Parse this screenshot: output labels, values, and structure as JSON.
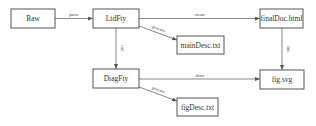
{
  "diagram": {
    "nodes": [
      {
        "id": "raw",
        "label": "Raw"
      },
      {
        "id": "ltdfty",
        "label": "LtdFty"
      },
      {
        "id": "finaldoc",
        "label": "finalDoc.html"
      },
      {
        "id": "maindesc",
        "label": "mainDesc.txt"
      },
      {
        "id": "diagfty",
        "label": "DiagFty"
      },
      {
        "id": "figsvg",
        "label": "fig.svg"
      },
      {
        "id": "figdesc",
        "label": "figDesc.txt"
      }
    ],
    "edges": [
      {
        "from": "raw",
        "to": "ltdfty",
        "label": "parse"
      },
      {
        "from": "ltdfty",
        "to": "finaldoc",
        "label": "create"
      },
      {
        "from": "ltdfty",
        "to": "maindesc",
        "label": "process"
      },
      {
        "from": "ltdfty",
        "to": "diagfty",
        "label": "call"
      },
      {
        "from": "finaldoc",
        "to": "figsvg",
        "label": "link"
      },
      {
        "from": "diagfty",
        "to": "figsvg",
        "label": "draw"
      },
      {
        "from": "diagfty",
        "to": "figdesc",
        "label": "process"
      }
    ],
    "colors": {
      "stroke": "#555555",
      "text": "#333333",
      "background": "#ffffff"
    }
  }
}
